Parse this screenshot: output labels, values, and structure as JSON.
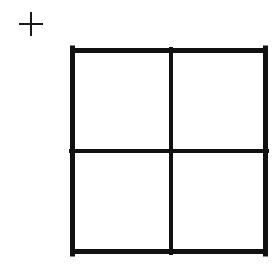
{
  "figure": {
    "background_color": "#ffffff",
    "ink_color": "#111111",
    "canvas": {
      "width": 278,
      "height": 269
    },
    "caption": "",
    "crosshair_mark": {
      "label": "+",
      "icon": "plus-icon",
      "center_x": 31,
      "center_y": 24,
      "arm_length": 12,
      "stroke_width": 2,
      "color": "#1a1a1a"
    },
    "grid_square": {
      "label": "2x2 grid square",
      "left": 70,
      "top": 48,
      "right": 268,
      "bottom": 254,
      "width": 198,
      "height": 206,
      "border_width": 5,
      "divider_width": 4,
      "vertical_divider_x": 171,
      "horizontal_divider_y": 151,
      "rows": 2,
      "columns": 2,
      "color": "#111111",
      "cells": [
        {
          "name": "top-left-cell",
          "row": 0,
          "column": 0,
          "value": ""
        },
        {
          "name": "top-right-cell",
          "row": 0,
          "column": 1,
          "value": ""
        },
        {
          "name": "bottom-left-cell",
          "row": 1,
          "column": 0,
          "value": ""
        },
        {
          "name": "bottom-right-cell",
          "row": 1,
          "column": 1,
          "value": ""
        }
      ]
    }
  }
}
